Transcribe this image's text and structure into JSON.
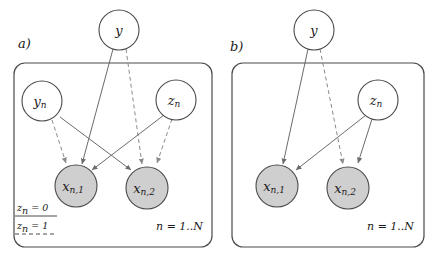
{
  "figure": {
    "title": "",
    "colors": {
      "observed_node_fill": "#cfcfcf",
      "latent_node_fill": "#ffffff",
      "stroke": "#4a4a4a",
      "solid_edge": "#6b6b6b",
      "dashed_edge": "#8a8a8a",
      "background": "#ffffff"
    }
  },
  "panels": [
    {
      "id": "a",
      "label": "a)",
      "plate_label": "n = 1..N",
      "nodes": [
        {
          "id": "y",
          "label": "y",
          "sub": "",
          "observed": false,
          "in_plate": false
        },
        {
          "id": "yn",
          "label": "y",
          "sub": "n",
          "observed": false,
          "in_plate": true
        },
        {
          "id": "zn",
          "label": "z",
          "sub": "n",
          "observed": false,
          "in_plate": true
        },
        {
          "id": "xn1",
          "label": "x",
          "sub": "n,1",
          "observed": true,
          "in_plate": true
        },
        {
          "id": "xn2",
          "label": "x",
          "sub": "n,2",
          "observed": true,
          "in_plate": true
        }
      ],
      "edges": [
        {
          "from": "y",
          "to": "xn1",
          "style": "solid"
        },
        {
          "from": "y",
          "to": "xn2",
          "style": "dashed"
        },
        {
          "from": "yn",
          "to": "xn1",
          "style": "dashed"
        },
        {
          "from": "yn",
          "to": "xn2",
          "style": "solid"
        },
        {
          "from": "zn",
          "to": "xn1",
          "style": "solid"
        },
        {
          "from": "zn",
          "to": "xn2",
          "style": "dashed"
        }
      ],
      "legend": [
        {
          "label_base": "z",
          "label_sub": "n",
          "label_eq": " = 0",
          "style": "solid"
        },
        {
          "label_base": "z",
          "label_sub": "n",
          "label_eq": " = 1",
          "style": "dashed"
        }
      ]
    },
    {
      "id": "b",
      "label": "b)",
      "plate_label": "n = 1..N",
      "nodes": [
        {
          "id": "y",
          "label": "y",
          "sub": "",
          "observed": false,
          "in_plate": false
        },
        {
          "id": "zn",
          "label": "z",
          "sub": "n",
          "observed": false,
          "in_plate": true
        },
        {
          "id": "xn1",
          "label": "x",
          "sub": "n,1",
          "observed": true,
          "in_plate": true
        },
        {
          "id": "xn2",
          "label": "x",
          "sub": "n,2",
          "observed": true,
          "in_plate": true
        }
      ],
      "edges": [
        {
          "from": "y",
          "to": "xn1",
          "style": "solid"
        },
        {
          "from": "y",
          "to": "xn2",
          "style": "dashed"
        },
        {
          "from": "zn",
          "to": "xn1",
          "style": "solid"
        },
        {
          "from": "zn",
          "to": "xn2",
          "style": "solid"
        }
      ],
      "legend": []
    }
  ]
}
